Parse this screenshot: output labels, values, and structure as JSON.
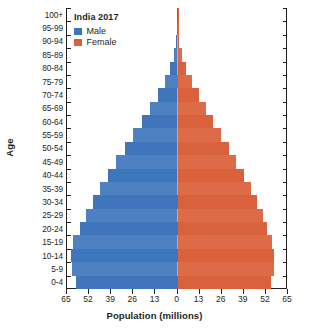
{
  "chart_data": {
    "type": "bar",
    "subtype": "population-pyramid",
    "title": "India 2017",
    "xlabel": "Population (millions)",
    "ylabel": "Age",
    "grid": false,
    "legend_position": "top-left",
    "xlim": [
      -65,
      65
    ],
    "xticks": [
      65,
      52,
      39,
      26,
      13,
      0,
      13,
      26,
      39,
      52,
      65
    ],
    "xtick_values": [
      -65,
      -52,
      -39,
      -26,
      -13,
      0,
      13,
      26,
      39,
      52,
      65
    ],
    "categories": [
      "0-4",
      "5-9",
      "10-14",
      "15-19",
      "20-24",
      "25-29",
      "30-34",
      "35-39",
      "40-44",
      "45-49",
      "50-54",
      "55-59",
      "60-64",
      "65-69",
      "70-74",
      "75-79",
      "80-84",
      "85-89",
      "90-94",
      "95-99",
      "100+"
    ],
    "series": [
      {
        "name": "Male",
        "color": "#3f76bb",
        "values": [
          60.0,
          62.0,
          62.5,
          61.5,
          57.5,
          54.0,
          50.0,
          45.5,
          41.0,
          36.0,
          31.0,
          26.0,
          21.0,
          16.0,
          11.5,
          7.5,
          4.5,
          2.0,
          0.7,
          0.2,
          0.05
        ]
      },
      {
        "name": "Female",
        "color": "#d9613c",
        "values": [
          55.0,
          56.5,
          57.0,
          55.5,
          52.5,
          50.0,
          47.0,
          43.0,
          39.0,
          34.5,
          30.0,
          25.5,
          21.0,
          16.5,
          12.5,
          8.5,
          5.0,
          2.5,
          0.9,
          0.25,
          0.06
        ]
      }
    ]
  },
  "legend": {
    "title": "India 2017",
    "items": [
      {
        "label": "Male",
        "color": "#3f76bb"
      },
      {
        "label": "Female",
        "color": "#d9613c"
      }
    ]
  },
  "axes": {
    "y_title": "Age",
    "x_title": "Population (millions)",
    "y_tick_labels": [
      "100+",
      "95-99",
      "90-94",
      "85-89",
      "80-84",
      "75-79",
      "70-74",
      "65-69",
      "60-64",
      "55-59",
      "50-54",
      "45-49",
      "40-44",
      "35-39",
      "30-34",
      "25-29",
      "20-24",
      "15-19",
      "10-14",
      "5-9",
      "0-4"
    ],
    "x_tick_labels": [
      "65",
      "52",
      "39",
      "26",
      "13",
      "0",
      "13",
      "26",
      "39",
      "52",
      "65"
    ]
  }
}
